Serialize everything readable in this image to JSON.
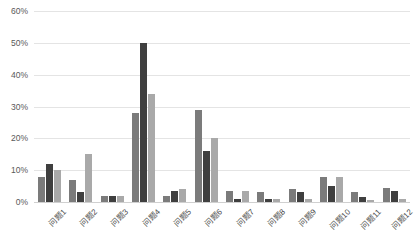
{
  "chart_data": {
    "type": "bar",
    "title": "",
    "subtitle": "",
    "xlabel": "",
    "ylabel": "",
    "ylim": [
      0,
      60
    ],
    "ytick_labels": [
      "60%",
      "50%",
      "40%",
      "30%",
      "20%",
      "10%",
      "0%"
    ],
    "ytick_values": [
      60,
      50,
      40,
      30,
      20,
      10,
      0
    ],
    "grid": true,
    "legend": false,
    "legend_position": "none",
    "value_suffix": "%",
    "categories": [
      "问题1",
      "问题2",
      "问题3",
      "问题4",
      "问题5",
      "问题6",
      "问题7",
      "问题8",
      "问题9",
      "问题10",
      "问题11",
      "问题12"
    ],
    "series": [
      {
        "name": "series-1",
        "color": "#7b7b7b",
        "values": [
          8,
          7,
          2,
          28,
          2,
          29,
          3.5,
          3,
          4,
          8,
          3,
          4.5
        ]
      },
      {
        "name": "series-2",
        "color": "#3f3f3f",
        "values": [
          12,
          3,
          2,
          50,
          3.5,
          16,
          1,
          1,
          3,
          5,
          1.5,
          3.5
        ]
      },
      {
        "name": "series-3",
        "color": "#a9a9a9",
        "values": [
          10,
          15,
          2,
          34,
          4,
          20,
          3.5,
          1,
          1,
          8,
          0.5,
          1
        ]
      }
    ]
  },
  "colors": {
    "background": "#ffffff",
    "gridline": "#e4e4e4",
    "baseline": "#d0d0d0",
    "axis_text": "#595959",
    "label_text": "#4a4a4a"
  }
}
